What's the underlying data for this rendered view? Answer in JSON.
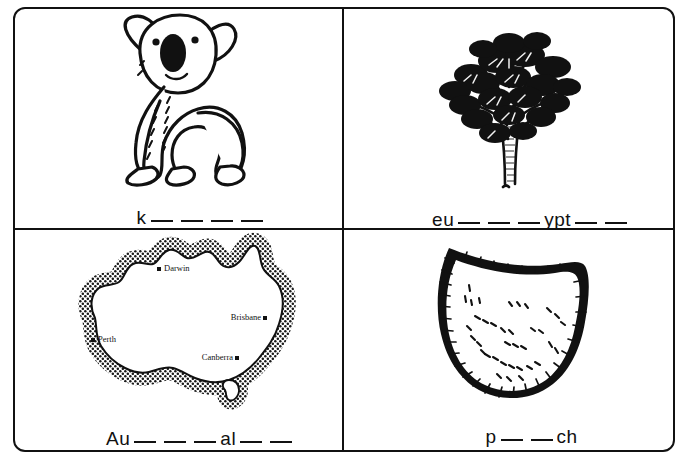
{
  "worksheet": {
    "title": "Australia vocabulary picture worksheet",
    "cells": [
      {
        "id": "koala",
        "image_name": "koala-illustration",
        "image_description": "Black and white line drawing of a koala sitting, facing forward",
        "prefix": "k",
        "blanks_after_prefix": 4,
        "suffix": "",
        "blanks_after_suffix": 0,
        "answer": "koala"
      },
      {
        "id": "eucalyptus",
        "image_name": "eucalyptus-tree-illustration",
        "image_description": "Black and white drawing of a eucalyptus gum tree with dense clustered foliage",
        "prefix": "eu",
        "blanks_after_prefix": 3,
        "suffix": "ypt",
        "blanks_after_suffix": 2,
        "answer": "eucalyptus"
      },
      {
        "id": "australia",
        "image_name": "australia-map-illustration",
        "image_description": "Stippled outline map of Australia with Tasmania and four labelled cities",
        "prefix": "Au",
        "blanks_after_prefix": 3,
        "suffix": "al",
        "blanks_after_suffix": 2,
        "answer": "Australia",
        "map_labels": [
          {
            "name": "Darwin",
            "x": 45,
            "y": 15
          },
          {
            "name": "Brisbane",
            "x": 77,
            "y": 44
          },
          {
            "name": "Perth",
            "x": 13,
            "y": 57
          },
          {
            "name": "Canberra",
            "x": 68,
            "y": 72
          }
        ]
      },
      {
        "id": "pouch",
        "image_name": "pouch-illustration",
        "image_description": "Black and white drawing of a marsupial pouch, crescent shaped with furry edges",
        "prefix": "p",
        "blanks_after_prefix": 2,
        "suffix": "ch",
        "blanks_after_suffix": 0,
        "answer": "pouch"
      }
    ]
  },
  "colors": {
    "ink": "#111111",
    "paper": "#ffffff"
  }
}
